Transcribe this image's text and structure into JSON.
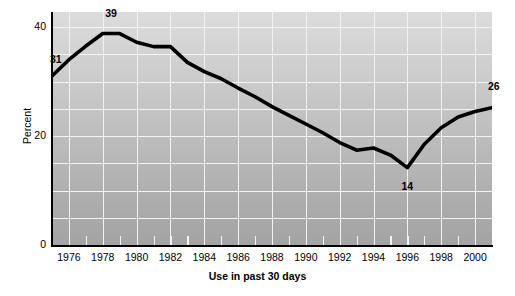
{
  "axes": {
    "y_title": "Percent",
    "x_title": "Use in past 30 days",
    "y_ticks": [
      "0",
      "20",
      "40"
    ],
    "x_ticks": [
      "1976",
      "1978",
      "1980",
      "1982",
      "1984",
      "1986",
      "1988",
      "1990",
      "1992",
      "1994",
      "1996",
      "1998",
      "2000"
    ]
  },
  "annotations": {
    "start": "31",
    "peak": "39",
    "trough": "14",
    "end": "26"
  },
  "chart_data": {
    "type": "line",
    "title": "",
    "xlabel": "Use in past 30 days",
    "ylabel": "Percent",
    "xlim": [
      1975,
      2001
    ],
    "ylim": [
      0,
      42
    ],
    "grid": true,
    "legend": false,
    "x": [
      1975,
      1976,
      1977,
      1978,
      1979,
      1980,
      1981,
      1982,
      1983,
      1984,
      1985,
      1986,
      1987,
      1988,
      1989,
      1990,
      1991,
      1992,
      1993,
      1994,
      1995,
      1996,
      1997,
      1998,
      1999,
      2000,
      2001
    ],
    "series": [
      {
        "name": "Use in past 30 days",
        "values": [
          31,
          34,
          36.5,
          38.8,
          38.8,
          37.2,
          36.4,
          36.4,
          33.5,
          31.8,
          30.5,
          28.8,
          27.2,
          25.4,
          23.8,
          22.2,
          20.6,
          18.8,
          17.4,
          17.8,
          16.5,
          14.2,
          18.5,
          21.5,
          23.5,
          24.5,
          25.2
        ]
      }
    ],
    "x_labeled_ticks": [
      1976,
      1978,
      1980,
      1982,
      1984,
      1986,
      1988,
      1990,
      1992,
      1994,
      1996,
      1998,
      2000
    ],
    "y_labeled_ticks": [
      0,
      20,
      40
    ],
    "point_labels": [
      {
        "x": 1975,
        "y": 31,
        "text": "31"
      },
      {
        "x": 1978.5,
        "y": 39,
        "text": "39"
      },
      {
        "x": 1996,
        "y": 14,
        "text": "14"
      },
      {
        "x": 2001,
        "y": 26,
        "text": "26"
      }
    ],
    "colors": {
      "line": "#000000",
      "plot_background": "#bfbfbf",
      "grid": "#f2f2f2"
    }
  }
}
